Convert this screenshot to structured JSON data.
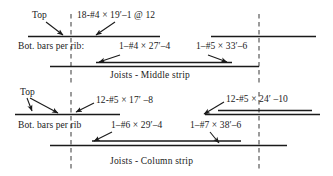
{
  "figure": {
    "title_middle": "Joists - Middle strip",
    "title_column": "Joists - Column strip"
  },
  "middle_strip": {
    "top_label": "Top",
    "top_bar_callout": "18-#4 × 19′–1 @ 12",
    "bottom_bars_label": "Bot. bars per rib:",
    "bottom_bar_callout_left": "1–#4 × 27′–4",
    "bottom_bar_callout_right": "1–#5 × 33′–6",
    "caption": "Joists - Middle strip"
  },
  "column_strip": {
    "top_label": "Top",
    "top_bar_callout_left": "12-#5 × 17′ –8",
    "top_bar_callout_right": "12-#5 × 24′ –10",
    "bottom_bars_label": "Bot. bars per rib",
    "bottom_bar_callout_left": "1–#6 × 29′–4",
    "bottom_bar_callout_right": "1–#7 × 38′–6",
    "caption": "Joists - Column strip"
  },
  "colors": {
    "ink": "#1a1a1a",
    "line": "#1f1f1f",
    "grid": "#555555",
    "background": "#ffffff"
  }
}
